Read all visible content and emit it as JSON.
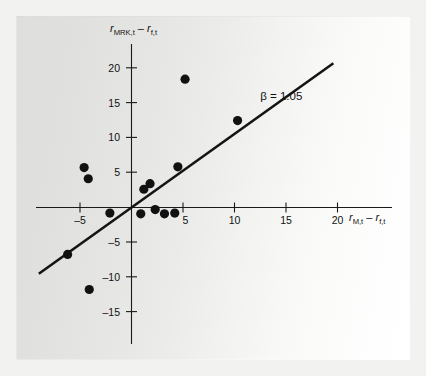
{
  "figure": {
    "background_outer": "#f2f2f0",
    "plate_gradient_from": "#dededc",
    "plate_gradient_to": "#ffffff",
    "ink_color": "#111111"
  },
  "chart_data": {
    "type": "scatter",
    "title": "",
    "subtitle": "",
    "xlabel": "r_M,t − r_f,t",
    "ylabel": "r_MRK,t − r_f,t",
    "xlabel_parts": {
      "base": "r",
      "sub": "M,t",
      "minus": "–",
      "base2": "r",
      "sub2": "f,t"
    },
    "ylabel_parts": {
      "base": "r",
      "sub": "MRK,t",
      "minus": "–",
      "base2": "r",
      "sub2": "f,t"
    },
    "xlim": [
      -8.5,
      24.0
    ],
    "ylim": [
      -17.5,
      22.5
    ],
    "xticks": [
      -5,
      5,
      10,
      15,
      20
    ],
    "xtick_labels": [
      "–5",
      "5",
      "10",
      "15",
      "20"
    ],
    "yticks": [
      20,
      15,
      10,
      5,
      -5,
      -10,
      -15
    ],
    "ytick_labels": [
      "20",
      "15",
      "10",
      "5",
      "–5",
      "–10",
      "–15"
    ],
    "grid": false,
    "legend_position": "none",
    "x": [
      -6.2,
      -4.6,
      -4.2,
      -4.1,
      -2.1,
      0.9,
      1.2,
      1.8,
      2.3,
      3.2,
      4.2,
      4.5,
      5.2,
      10.3
    ],
    "y": [
      -6.7,
      5.7,
      4.1,
      -11.7,
      -0.8,
      -0.9,
      2.6,
      3.4,
      -0.3,
      -0.9,
      -0.8,
      5.8,
      18.3,
      12.4
    ],
    "points": [
      {
        "x": -6.2,
        "y": -6.7
      },
      {
        "x": -4.6,
        "y": 5.7
      },
      {
        "x": -4.2,
        "y": 4.1
      },
      {
        "x": -4.1,
        "y": -11.7
      },
      {
        "x": -2.1,
        "y": -0.8
      },
      {
        "x": 0.9,
        "y": -0.9
      },
      {
        "x": 1.2,
        "y": 2.6
      },
      {
        "x": 1.8,
        "y": 3.4
      },
      {
        "x": 2.3,
        "y": -0.3
      },
      {
        "x": 3.2,
        "y": -0.9
      },
      {
        "x": 4.2,
        "y": -0.8
      },
      {
        "x": 4.5,
        "y": 5.8
      },
      {
        "x": 5.2,
        "y": 18.3
      },
      {
        "x": 10.3,
        "y": 12.4
      }
    ],
    "marker": "circle",
    "marker_size_px": 4.6,
    "fit_line": {
      "slope": 1.05,
      "intercept": 0.0,
      "x_start": -9.0,
      "x_end": 19.6,
      "label": "β = 1.05"
    },
    "annotations": [
      {
        "text": "β = 1.05",
        "x": 12.5,
        "y": 15.3
      }
    ]
  }
}
